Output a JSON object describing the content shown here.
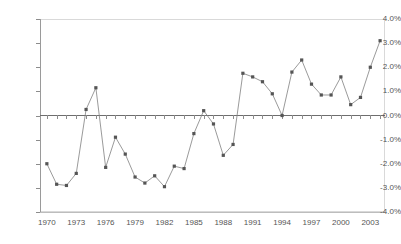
{
  "chart_data": {
    "type": "line",
    "title": "",
    "subtitle": "",
    "xlabel": "",
    "ylabel": "",
    "grid": false,
    "legend": null,
    "legend_position": "none",
    "marker": "square",
    "line_color": "#808080",
    "marker_color": "#555555",
    "axis_color": "#9a9a9a",
    "zero_line_color": "#6e6e6e",
    "xlim": [
      1969.3,
      2004.5
    ],
    "ylim": [
      -4.0,
      4.0
    ],
    "y_tick_labels": [
      "4.0%",
      "3.0%",
      "2.0%",
      "1.0%",
      "0.0%",
      "-1.0%",
      "-2.0%",
      "-3.0%",
      "-4.0%"
    ],
    "y_tick_values": [
      4.0,
      3.0,
      2.0,
      1.0,
      0.0,
      -1.0,
      -2.0,
      -3.0,
      -4.0
    ],
    "x_tick_labels": [
      "1970",
      "1973",
      "1976",
      "1979",
      "1982",
      "1985",
      "1988",
      "1991",
      "1994",
      "1997",
      "2000",
      "2003"
    ],
    "x_tick_values": [
      1970,
      1973,
      1976,
      1979,
      1982,
      1985,
      1988,
      1991,
      1994,
      1997,
      2000,
      2003
    ],
    "x": [
      1970,
      1971,
      1972,
      1973,
      1974,
      1975,
      1976,
      1977,
      1978,
      1979,
      1980,
      1981,
      1982,
      1983,
      1984,
      1985,
      1986,
      1987,
      1988,
      1989,
      1990,
      1991,
      1992,
      1993,
      1994,
      1995,
      1996,
      1997,
      1998,
      1999,
      2000,
      2001,
      2002,
      2003,
      2004
    ],
    "values": [
      -2.0,
      -2.85,
      -2.9,
      -2.4,
      0.25,
      1.15,
      -2.15,
      -0.9,
      -1.6,
      -2.55,
      -2.8,
      -2.5,
      -2.95,
      -2.1,
      -2.2,
      -0.75,
      0.2,
      -0.35,
      -1.65,
      -1.2,
      1.75,
      1.6,
      1.4,
      0.9,
      0.0,
      1.8,
      2.3,
      1.3,
      0.85,
      0.85,
      1.6,
      0.45,
      0.75,
      2.0,
      3.1
    ],
    "unit": "%",
    "series_name": ""
  }
}
